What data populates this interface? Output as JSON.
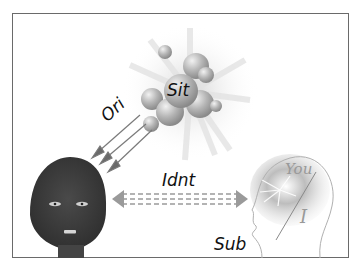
{
  "labels": {
    "situation": "Sit",
    "orientation": "Ori",
    "identity": "Idnt",
    "subject": "Sub",
    "you": "You",
    "i": "I"
  },
  "colors": {
    "frame": "#6a6a6a",
    "face_dark": "#3d3d3d",
    "sphere": "#9a9a9a",
    "arrow": "#7a7a7a",
    "text": "#111111"
  }
}
